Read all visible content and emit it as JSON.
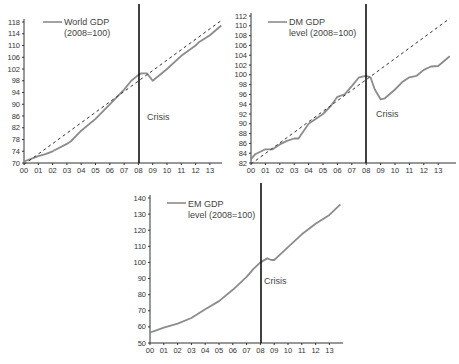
{
  "chart_data": [
    {
      "type": "line",
      "title": "",
      "legend": [
        "World GDP",
        "(2008=100)"
      ],
      "xlabel": "",
      "ylabel": "",
      "x_tick_labels": [
        "00",
        "01",
        "02",
        "03",
        "04",
        "05",
        "06",
        "07",
        "08",
        "09",
        "10",
        "11",
        "12",
        "13"
      ],
      "y_ticks": [
        70,
        74,
        78,
        82,
        86,
        90,
        94,
        98,
        102,
        106,
        110,
        114,
        118
      ],
      "ylim": [
        70,
        120
      ],
      "xlim": [
        0,
        13.9
      ],
      "annotation": {
        "text": "Crisis",
        "x": 8.1,
        "y": 85
      },
      "vline_x": 8,
      "series": [
        {
          "name": "World GDP (2008=100)",
          "style": "solid",
          "x": [
            0,
            1,
            1.5,
            2,
            3,
            3.3,
            4,
            5,
            6,
            7,
            7.5,
            8,
            8.2,
            8.6,
            9,
            10,
            11,
            12,
            12.2,
            13,
            13.8
          ],
          "values": [
            70.5,
            72.3,
            73,
            74,
            76.5,
            77.5,
            81,
            85,
            90,
            95,
            98,
            100,
            100.5,
            100.5,
            98,
            102,
            106.5,
            110,
            111,
            113.5,
            116.8
          ]
        },
        {
          "name": "Pre-crisis trend",
          "style": "dashed",
          "x": [
            0,
            13.8
          ],
          "values": [
            69.5,
            118.5
          ]
        }
      ]
    },
    {
      "type": "line",
      "title": "",
      "legend": [
        "DM GDP",
        "level (2008=100)"
      ],
      "xlabel": "",
      "ylabel": "",
      "x_tick_labels": [
        "00",
        "01",
        "02",
        "03",
        "04",
        "05",
        "06",
        "07",
        "08",
        "09",
        "10",
        "11",
        "12",
        "13"
      ],
      "y_ticks": [
        82,
        84,
        86,
        88,
        90,
        92,
        94,
        96,
        98,
        100,
        102,
        104,
        106,
        108,
        110,
        112
      ],
      "ylim": [
        82,
        112
      ],
      "xlim": [
        0,
        13.9
      ],
      "annotation": {
        "text": "Crisis",
        "x": 8.2,
        "y": 92.5
      },
      "vline_x": 8,
      "series": [
        {
          "name": "DM GDP level (2008=100)",
          "style": "solid",
          "x": [
            0,
            0.3,
            1,
            1.5,
            2,
            2.5,
            3,
            3.3,
            4,
            5,
            5.5,
            6,
            6.5,
            7,
            7.5,
            8,
            8.3,
            8.6,
            9,
            9.3,
            10,
            10.5,
            11,
            11.5,
            12,
            12.5,
            13,
            13.8
          ],
          "values": [
            82.8,
            83.8,
            84.8,
            84.8,
            85.8,
            86.5,
            87,
            87,
            90,
            92,
            93.5,
            95.5,
            96,
            97.7,
            99.5,
            99.8,
            99.5,
            97,
            95,
            95.2,
            97,
            98.5,
            99.5,
            99.8,
            101,
            101.7,
            101.8,
            103.8
          ]
        },
        {
          "name": "Pre-crisis trend",
          "style": "dashed",
          "x": [
            0,
            13.8
          ],
          "values": [
            81.8,
            111.5
          ]
        }
      ]
    },
    {
      "type": "line",
      "title": "",
      "legend": [
        "EM GDP",
        "level (2008=100)"
      ],
      "xlabel": "",
      "ylabel": "",
      "x_tick_labels": [
        "00",
        "01",
        "02",
        "03",
        "04",
        "05",
        "06",
        "07",
        "08",
        "09",
        "10",
        "11",
        "12",
        "13"
      ],
      "y_ticks": [
        50,
        60,
        70,
        80,
        90,
        100,
        110,
        120,
        130,
        140
      ],
      "ylim": [
        50,
        140
      ],
      "xlim": [
        0,
        13.9
      ],
      "annotation": {
        "text": "Crisis",
        "x": 8.1,
        "y": 90
      },
      "vline_x": 8,
      "series": [
        {
          "name": "EM GDP level (2008=100)",
          "style": "solid",
          "x": [
            0,
            0.5,
            1,
            2,
            3,
            4,
            5,
            6,
            7,
            7.5,
            8,
            8.5,
            8.8,
            9,
            9.5,
            10,
            11,
            12,
            13,
            13.8
          ],
          "values": [
            56.5,
            58,
            59.5,
            62,
            65.5,
            71,
            76,
            83,
            91,
            96,
            100,
            102.5,
            101.5,
            101.5,
            105.5,
            109.5,
            117.5,
            124,
            129.5,
            136
          ]
        }
      ]
    }
  ],
  "colors": {
    "series": "#8c8c8c",
    "trend": "#333333",
    "crisis_line": "#111111",
    "axis": "#333333"
  },
  "charts": [
    {
      "legend_line1": "World GDP",
      "legend_line2": "(2008=100)",
      "crisis_label": "Crisis"
    },
    {
      "legend_line1": "DM GDP",
      "legend_line2": "level (2008=100)",
      "crisis_label": "Crisis"
    },
    {
      "legend_line1": "EM GDP",
      "legend_line2": "level (2008=100)",
      "crisis_label": "Crisis"
    }
  ]
}
